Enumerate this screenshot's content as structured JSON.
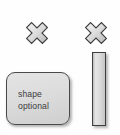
{
  "canvas": {
    "width": 120,
    "height": 135,
    "background_color": "#fefefe"
  },
  "icons": {
    "cross_left": "cross-icon",
    "cross_right": "cross-icon",
    "cross_fill_color": "#d8d8d8",
    "cross_outline_color": "#3a3a3a"
  },
  "shape_box": {
    "label": "shape\noptional",
    "label_line1": "shape",
    "label_line2": "optional",
    "fill_color": "#dcdcdc",
    "border_color": "#4a4a4a",
    "text_color": "#3c3c3c"
  },
  "vertical_bar": {
    "fill_color": "#dadada",
    "border_color": "#3f3f3f"
  }
}
